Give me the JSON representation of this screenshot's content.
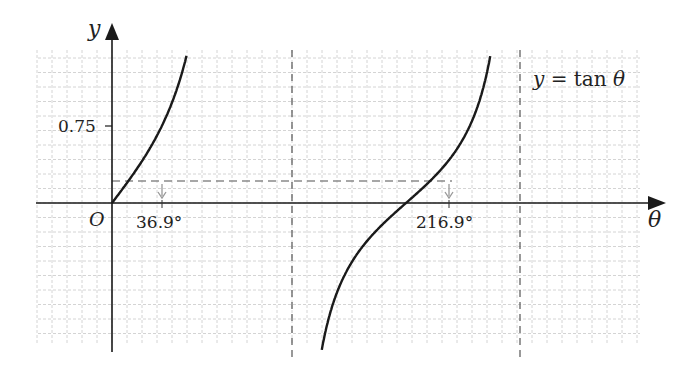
{
  "chart_data": {
    "type": "line",
    "title": "",
    "function_label": "y = tan θ",
    "xlabel": "θ",
    "ylabel": "y",
    "origin_label": "O",
    "y_tick_labels": [
      "0.75"
    ],
    "x_tick_labels": [
      "36.9°",
      "216.9°"
    ],
    "asymptotes_deg": [
      90,
      270
    ],
    "horizontal_reference": {
      "y": 0.75,
      "style": "dashed"
    },
    "solutions_deg": [
      36.9,
      216.9
    ],
    "series": [
      {
        "name": "y = tan θ (branch 1)",
        "x_deg": [
          0,
          20,
          36.9,
          50,
          60,
          70,
          75
        ],
        "y": [
          0,
          0.36,
          0.75,
          1.19,
          1.73,
          2.75,
          3.73
        ]
      },
      {
        "name": "y = tan θ (branch 2)",
        "x_deg": [
          95,
          110,
          130,
          150,
          170,
          180,
          200,
          216.9,
          230,
          250,
          265
        ],
        "y": [
          -11.4,
          -2.75,
          -1.19,
          -0.58,
          -0.18,
          0,
          0.36,
          0.75,
          1.19,
          2.75,
          11.4
        ]
      }
    ],
    "grid": true,
    "legend": "none"
  },
  "labels": {
    "y_axis": "y",
    "theta_axis": "θ",
    "origin": "O",
    "tick_075": "0.75",
    "sol1": "36.9°",
    "sol2": "216.9°",
    "func_y": "y",
    "func_eq": " = tan ",
    "func_theta": "θ"
  },
  "colors": {
    "curve": "#1a1a1a",
    "axis": "#1a1a1a",
    "grid": "#d4d4d4",
    "dashed": "#8a8a8a"
  }
}
